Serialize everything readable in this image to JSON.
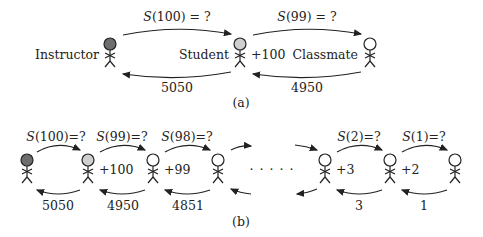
{
  "panel_a": {
    "caption": "(a)",
    "nodes": [
      {
        "label": "Instructor",
        "fill": "#6e6e6e"
      },
      {
        "label": "Student",
        "fill": "#cfcfcf",
        "annotation": "+100"
      },
      {
        "label": "Classmate",
        "fill": "#ffffff"
      }
    ],
    "forward_labels": [
      {
        "fn": "S",
        "arg": "(100) = ?"
      },
      {
        "fn": "S",
        "arg": "(99) = ?"
      }
    ],
    "return_labels": [
      "5050",
      "4950"
    ]
  },
  "panel_b": {
    "caption": "(b)",
    "ellipsis": "· · · · ·",
    "annotations": [
      "+100",
      "+99",
      "+3",
      "+2"
    ],
    "forward_labels": [
      {
        "fn": "S",
        "arg": "(100)=?"
      },
      {
        "fn": "S",
        "arg": "(99)=?"
      },
      {
        "fn": "S",
        "arg": "(98)=?"
      },
      {
        "fn": "S",
        "arg": "(2)=?"
      },
      {
        "fn": "S",
        "arg": "(1)=?"
      }
    ],
    "return_labels": [
      "5050",
      "4950",
      "4851",
      "3",
      "1"
    ]
  },
  "colors": {
    "instructor": "#6e6e6e",
    "student": "#cfcfcf",
    "classmate": "#ffffff",
    "stroke": "#222222"
  }
}
